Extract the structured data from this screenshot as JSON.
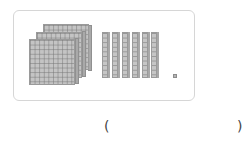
{
  "figure": {
    "hundreds_flats": 3,
    "tens_rods": 6,
    "ones_units": 1
  },
  "answer": {
    "open_paren": "(",
    "close_paren": ")",
    "value": ""
  },
  "colors": {
    "block_fill": "#c4c4c4",
    "block_line": "#8c8c8c",
    "frame_border": "#d6d6d6"
  }
}
